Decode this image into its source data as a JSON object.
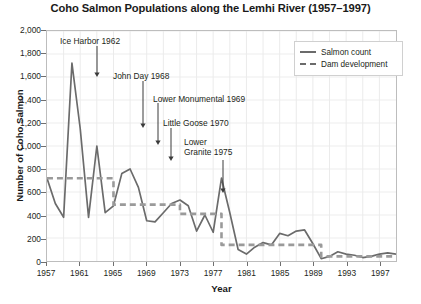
{
  "chart_data": {
    "type": "line",
    "title": "Coho Salmon Populations along the Lemhi River (1957–1997)",
    "xlabel": "Year",
    "ylabel": "Number of Coho Salmon",
    "xlim": [
      1957,
      1999
    ],
    "ylim": [
      0,
      2000
    ],
    "grid": true,
    "legend_position": "top-right",
    "ytick_labels": [
      "0",
      "200",
      "400",
      "600",
      "800",
      "1,000",
      "1,200",
      "1,400",
      "1,600",
      "1,800",
      "2,000"
    ],
    "ytick_values": [
      0,
      200,
      400,
      600,
      800,
      1000,
      1200,
      1400,
      1600,
      1800,
      2000
    ],
    "xtick_labels": [
      "1957",
      "1961",
      "1965",
      "1969",
      "1973",
      "1977",
      "1981",
      "1985",
      "1989",
      "1993",
      "1997"
    ],
    "xtick_values": [
      1957,
      1961,
      1965,
      1969,
      1973,
      1977,
      1981,
      1985,
      1989,
      1993,
      1997
    ],
    "series": [
      {
        "name": "Salmon count",
        "style": "solid",
        "color": "#6b6b6b",
        "x": [
          1957,
          1958,
          1959,
          1960,
          1961,
          1962,
          1963,
          1964,
          1965,
          1966,
          1967,
          1968,
          1969,
          1970,
          1971,
          1972,
          1973,
          1974,
          1975,
          1976,
          1977,
          1978,
          1979,
          1980,
          1981,
          1982,
          1983,
          1984,
          1985,
          1986,
          1987,
          1988,
          1989,
          1990,
          1991,
          1992,
          1993,
          1994,
          1995,
          1996,
          1997,
          1998,
          1999
        ],
        "values": [
          720,
          500,
          380,
          1720,
          1150,
          380,
          1000,
          420,
          480,
          760,
          800,
          640,
          350,
          340,
          420,
          500,
          530,
          480,
          260,
          400,
          250,
          720,
          420,
          100,
          60,
          120,
          160,
          140,
          240,
          220,
          260,
          270,
          150,
          20,
          40,
          80,
          60,
          50,
          30,
          40,
          60,
          70,
          60
        ]
      },
      {
        "name": "Dam development",
        "style": "dashed",
        "color": "#9a9a9a",
        "steps": [
          {
            "from": 1957,
            "to": 1965,
            "value": 720
          },
          {
            "from": 1965,
            "to": 1973,
            "value": 490
          },
          {
            "from": 1973,
            "to": 1978,
            "value": 410
          },
          {
            "from": 1978,
            "to": 1990,
            "value": 140
          },
          {
            "from": 1990,
            "to": 1999,
            "value": 40
          }
        ]
      }
    ],
    "annotations": [
      {
        "label": "Ice Harbor 1962",
        "year": 1962,
        "text_x": 60,
        "text_y": 36,
        "arrow_x": 97,
        "arrow_y0": 46,
        "arrow_y1": 77
      },
      {
        "label": "John Day 1968",
        "year": 1968,
        "text_x": 113,
        "text_y": 71,
        "arrow_x": 143,
        "arrow_y0": 81,
        "arrow_y1": 128
      },
      {
        "label": "Lower Monumental 1969",
        "year": 1969,
        "text_x": 153,
        "text_y": 94,
        "arrow_x": 158,
        "arrow_y0": 103,
        "arrow_y1": 145
      },
      {
        "label": "Little Goose 1970",
        "year": 1970,
        "text_x": 163,
        "text_y": 118,
        "arrow_x": 171,
        "arrow_y0": 128,
        "arrow_y1": 161
      },
      {
        "label": "Lower Granite 1975",
        "year": 1975,
        "text_x": 184,
        "text_y": 137,
        "arrow_x": 223,
        "arrow_y0": 160,
        "arrow_y1": 193
      }
    ]
  },
  "legend": {
    "items": [
      {
        "label": "Salmon count"
      },
      {
        "label": "Dam development"
      }
    ]
  }
}
